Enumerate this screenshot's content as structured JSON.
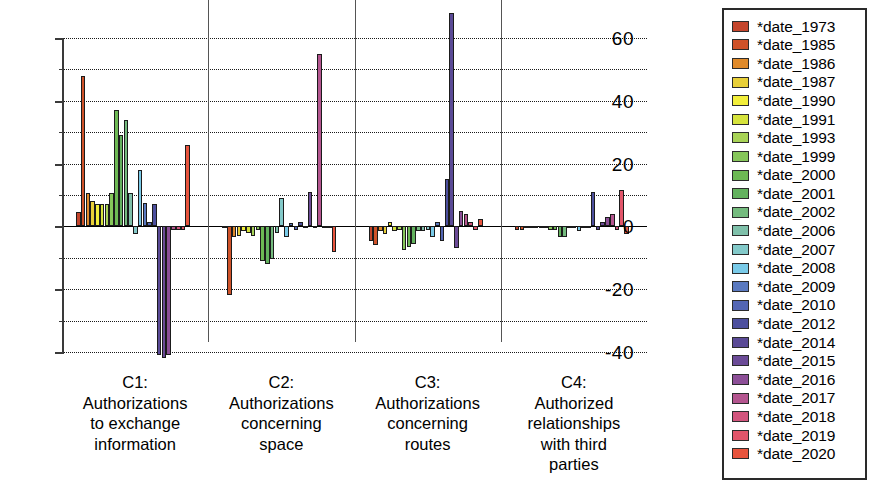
{
  "legend": {
    "position": "right",
    "items": [
      {
        "label": "*date_1973",
        "color": "#c4452c"
      },
      {
        "label": "*date_1985",
        "color": "#cf5229"
      },
      {
        "label": "*date_1986",
        "color": "#e08a2a"
      },
      {
        "label": "*date_1987",
        "color": "#e8cf38"
      },
      {
        "label": "*date_1990",
        "color": "#f2ee3a"
      },
      {
        "label": "*date_1991",
        "color": "#d6e33c"
      },
      {
        "label": "*date_1993",
        "color": "#a8d356"
      },
      {
        "label": "*date_1999",
        "color": "#86c65a"
      },
      {
        "label": "*date_2000",
        "color": "#6db954"
      },
      {
        "label": "*date_2001",
        "color": "#63b25e"
      },
      {
        "label": "*date_2002",
        "color": "#74bb7e"
      },
      {
        "label": "*date_2006",
        "color": "#7fc0aa"
      },
      {
        "label": "*date_2007",
        "color": "#83c9c9"
      },
      {
        "label": "*date_2008",
        "color": "#79cae8"
      },
      {
        "label": "*date_2009",
        "color": "#5a79c0"
      },
      {
        "label": "*date_2010",
        "color": "#5366b4"
      },
      {
        "label": "*date_2012",
        "color": "#4c4f9e"
      },
      {
        "label": "*date_2014",
        "color": "#5a4a96"
      },
      {
        "label": "*date_2015",
        "color": "#6b4b97"
      },
      {
        "label": "*date_2016",
        "color": "#8c4f97"
      },
      {
        "label": "*date_2017",
        "color": "#b4558f"
      },
      {
        "label": "*date_2018",
        "color": "#d2557d"
      },
      {
        "label": "*date_2019",
        "color": "#e2556a"
      },
      {
        "label": "*date_2020",
        "color": "#e8543d"
      }
    ]
  },
  "yaxis": {
    "labels": [
      "60",
      "40",
      "20",
      "0",
      "-20",
      "-40"
    ],
    "label_values": [
      60,
      40,
      20,
      0,
      -20,
      -40
    ],
    "minor_values": [
      50,
      30,
      10,
      -10,
      -30
    ],
    "min": -40,
    "max": 60
  },
  "xaxis": {
    "groups": [
      {
        "id": "C1",
        "lines": [
          "C1:",
          "Authorizations",
          "to exchange",
          "information"
        ]
      },
      {
        "id": "C2",
        "lines": [
          "C2:",
          "Authorizations",
          "concerning",
          "space"
        ]
      },
      {
        "id": "C3",
        "lines": [
          "C3:",
          "Authorizations",
          "concerning",
          "routes"
        ]
      },
      {
        "id": "C4",
        "lines": [
          "C4:",
          "Authorized",
          "relationships",
          "with third",
          "parties"
        ]
      }
    ]
  },
  "chart_data": {
    "type": "bar",
    "title": "",
    "xlabel": "",
    "ylabel": "",
    "ylim": [
      -40,
      60
    ],
    "grid": true,
    "grid_step": 10,
    "legend_position": "right",
    "categories": [
      "C1: Authorizations to exchange information",
      "C2: Authorizations concerning space",
      "C3: Authorizations concerning routes",
      "C4: Authorized relationships with third parties"
    ],
    "series": [
      {
        "name": "*date_1973",
        "color": "#c4452c",
        "values": [
          4.5,
          -0.5,
          -4.5,
          -1.0
        ]
      },
      {
        "name": "*date_1985",
        "color": "#cf5229",
        "values": [
          48.0,
          -22.0,
          -6.0,
          -1.0
        ]
      },
      {
        "name": "*date_1986",
        "color": "#e08a2a",
        "values": [
          10.5,
          -3.5,
          -1.5,
          -0.5
        ]
      },
      {
        "name": "*date_1987",
        "color": "#e8cf38",
        "values": [
          8.0,
          -3.0,
          -2.5,
          -0.5
        ]
      },
      {
        "name": "*date_1990",
        "color": "#f2ee3a",
        "values": [
          7.0,
          -1.5,
          1.5,
          -0.5
        ]
      },
      {
        "name": "*date_1991",
        "color": "#d6e33c",
        "values": [
          7.0,
          -2.0,
          -1.5,
          -0.5
        ]
      },
      {
        "name": "*date_1993",
        "color": "#a8d356",
        "values": [
          7.0,
          -3.0,
          -1.0,
          -0.5
        ]
      },
      {
        "name": "*date_1999",
        "color": "#86c65a",
        "values": [
          10.5,
          -1.0,
          -7.5,
          -1.0
        ]
      },
      {
        "name": "*date_2000",
        "color": "#6db954",
        "values": [
          37.0,
          -11.0,
          -6.5,
          -1.0
        ]
      },
      {
        "name": "*date_2001",
        "color": "#63b25e",
        "values": [
          29.0,
          -12.0,
          -5.5,
          -3.5
        ]
      },
      {
        "name": "*date_2002",
        "color": "#74bb7e",
        "values": [
          34.0,
          -10.5,
          -1.5,
          -3.5
        ]
      },
      {
        "name": "*date_2006",
        "color": "#7fc0aa",
        "values": [
          10.5,
          -2.0,
          -1.5,
          -0.5
        ]
      },
      {
        "name": "*date_2007",
        "color": "#83c9c9",
        "values": [
          -2.5,
          9.0,
          -1.0,
          -0.5
        ]
      },
      {
        "name": "*date_2008",
        "color": "#79cae8",
        "values": [
          18.0,
          -3.5,
          -3.5,
          -1.5
        ]
      },
      {
        "name": "*date_2009",
        "color": "#5a79c0",
        "values": [
          7.5,
          1.0,
          1.5,
          -0.5
        ]
      },
      {
        "name": "*date_2010",
        "color": "#5366b4",
        "values": [
          1.5,
          -1.0,
          -4.5,
          -0.5
        ]
      },
      {
        "name": "*date_2012",
        "color": "#4c4f9e",
        "values": [
          7.0,
          1.5,
          15.0,
          11.0
        ]
      },
      {
        "name": "*date_2014",
        "color": "#5a4a96",
        "values": [
          -41.0,
          -0.5,
          68.0,
          -1.0
        ]
      },
      {
        "name": "*date_2015",
        "color": "#6b4b97",
        "values": [
          -42.0,
          11.0,
          -7.0,
          1.5
        ]
      },
      {
        "name": "*date_2016",
        "color": "#8c4f97",
        "values": [
          -41.0,
          -0.5,
          5.0,
          3.0
        ]
      },
      {
        "name": "*date_2017",
        "color": "#b4558f",
        "values": [
          -1.0,
          55.0,
          4.0,
          4.0
        ]
      },
      {
        "name": "*date_2018",
        "color": "#d2557d",
        "values": [
          -1.0,
          -0.5,
          1.5,
          -1.0
        ]
      },
      {
        "name": "*date_2019",
        "color": "#e2556a",
        "values": [
          -1.0,
          -0.5,
          -1.0,
          11.5
        ]
      },
      {
        "name": "*date_2020",
        "color": "#e8543d",
        "values": [
          26.0,
          -8.0,
          2.5,
          -2.5
        ]
      }
    ]
  }
}
